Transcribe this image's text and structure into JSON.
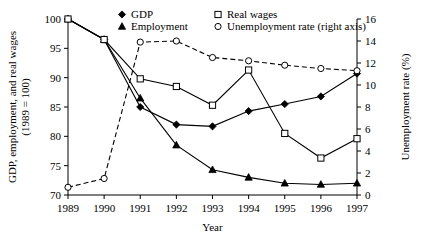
{
  "chart_data": {
    "type": "line",
    "title": "",
    "xlabel": "Year",
    "ylabel": "GDP, employment, and real wages (1989 = 100)",
    "ylabel_line1": "GDP, employment, and real wages",
    "ylabel_line2": "(1989 = 100)",
    "y2label": "Unemployment rate (%)",
    "categories": [
      "1989",
      "1990",
      "1991",
      "1992",
      "1993",
      "1994",
      "1995",
      "1996",
      "1997"
    ],
    "x": [
      1989,
      1990,
      1991,
      1992,
      1993,
      1994,
      1995,
      1996,
      1997
    ],
    "ylim": [
      70,
      100
    ],
    "yticks": [
      70,
      75,
      80,
      85,
      90,
      95,
      100
    ],
    "y2lim": [
      0,
      16
    ],
    "y2ticks": [
      0,
      2,
      4,
      6,
      8,
      10,
      12,
      14,
      16
    ],
    "grid": false,
    "legend_position": "top-inside",
    "series": [
      {
        "name": "GDP",
        "marker": "filled-diamond",
        "line": "solid",
        "axis": "left",
        "values": [
          100.0,
          96.5,
          85.0,
          82.0,
          81.7,
          84.3,
          85.5,
          86.8,
          90.7
        ]
      },
      {
        "name": "Employment",
        "marker": "filled-triangle",
        "line": "solid",
        "axis": "left",
        "values": [
          100.0,
          96.5,
          86.5,
          78.5,
          74.3,
          73.0,
          72.0,
          71.8,
          72.0
        ]
      },
      {
        "name": "Real wages",
        "marker": "open-square",
        "line": "solid",
        "axis": "left",
        "values": [
          100.0,
          96.5,
          89.8,
          88.5,
          85.3,
          91.3,
          80.5,
          76.3,
          79.6
        ]
      },
      {
        "name": "Unemployment rate (right axis)",
        "marker": "open-circle",
        "line": "dashed",
        "axis": "right",
        "values": [
          0.7,
          1.5,
          13.9,
          14.0,
          12.5,
          12.2,
          11.8,
          11.5,
          11.3
        ]
      }
    ]
  },
  "legend": {
    "items": [
      {
        "label": "GDP",
        "marker": "filled-diamond"
      },
      {
        "label": "Employment",
        "marker": "filled-triangle"
      },
      {
        "label": "Real wages",
        "marker": "open-square"
      },
      {
        "label": "Unemployment rate (right axis)",
        "marker": "open-circle"
      }
    ]
  }
}
